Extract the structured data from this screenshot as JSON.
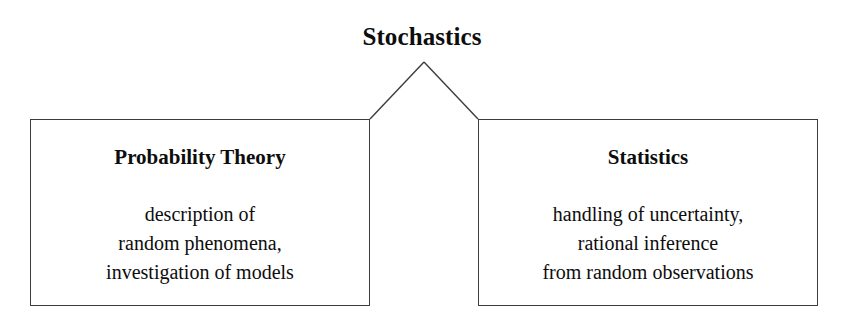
{
  "diagram": {
    "root": {
      "label": "Stochastics"
    },
    "branches": [
      {
        "title": "Probability Theory",
        "lines": [
          "description of",
          "random phenomena,",
          "investigation of models"
        ]
      },
      {
        "title": "Statistics",
        "lines": [
          "handling of uncertainty,",
          "rational inference",
          "from random observations"
        ]
      }
    ],
    "style": {
      "background": "#ffffff",
      "line_color": "#3c3c3c",
      "text_color": "#0d0d0d"
    }
  }
}
